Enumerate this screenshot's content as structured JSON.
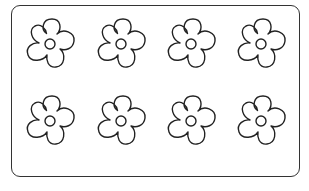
{
  "sheet": {
    "description": "Coloring page with eight outlined five-petal flowers in a rounded rectangle frame",
    "stroke_color": "#222222",
    "fill_color": "#ffffff",
    "rows": 2,
    "columns": 4,
    "flowers": [
      {
        "id": 1,
        "cx": 50,
        "cy": 44
      },
      {
        "id": 2,
        "cx": 121,
        "cy": 44
      },
      {
        "id": 3,
        "cx": 191,
        "cy": 44
      },
      {
        "id": 4,
        "cx": 261,
        "cy": 44
      },
      {
        "id": 5,
        "cx": 50,
        "cy": 121
      },
      {
        "id": 6,
        "cx": 121,
        "cy": 121
      },
      {
        "id": 7,
        "cx": 191,
        "cy": 121
      },
      {
        "id": 8,
        "cx": 261,
        "cy": 121
      }
    ]
  }
}
